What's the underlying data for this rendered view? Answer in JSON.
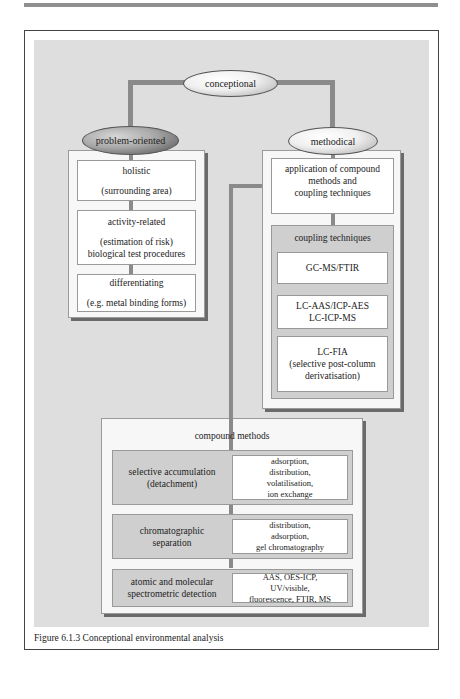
{
  "figure": {
    "caption": "Figure 6.1.3 Conceptional environmental analysis"
  },
  "root": {
    "label": "conceptional"
  },
  "problem_oriented": {
    "label": "problem-oriented",
    "boxes": [
      {
        "title": "holistic",
        "detail": "(surrounding area)"
      },
      {
        "title": "activity-related",
        "detail": "(estimation of risk)",
        "detail2": "biological test procedures"
      },
      {
        "title": "differentiating",
        "detail": "(e.g. metal binding forms)"
      }
    ]
  },
  "methodical": {
    "label": "methodical",
    "application_box": {
      "line1": "application of compound",
      "line2": "methods and",
      "line3": "coupling techniques"
    },
    "coupling": {
      "title": "coupling techniques",
      "items": [
        {
          "line1": "GC-MS/FTIR"
        },
        {
          "line1": "LC-AAS/ICP-AES",
          "line2": "LC-ICP-MS"
        },
        {
          "line1": "LC-FIA",
          "line2": "(selective post-column",
          "line3": "derivatisation)"
        }
      ]
    }
  },
  "compound_methods": {
    "title": "compound methods",
    "rows": [
      {
        "name_line1": "selective accumulation",
        "name_line2": "(detachment)",
        "methods": [
          "adsorption,",
          "distribution,",
          "volatilisation,",
          "ion exchange"
        ]
      },
      {
        "name_line1": "chromatographic",
        "name_line2": "separation",
        "methods": [
          "distribution,",
          "adsorption,",
          "gel chromatography"
        ]
      },
      {
        "name_line1": "atomic and molecular",
        "name_line2": "spectrometric detection",
        "methods": [
          "AAS, OES-ICP,",
          "UV/visible,",
          "fluorescence, FTIR, MS"
        ]
      }
    ]
  },
  "colors": {
    "panel": "#dedede",
    "connector": "#8a8a8a",
    "group_fill": "#f7f7f7",
    "inner_gray": "#cfcfcf"
  }
}
